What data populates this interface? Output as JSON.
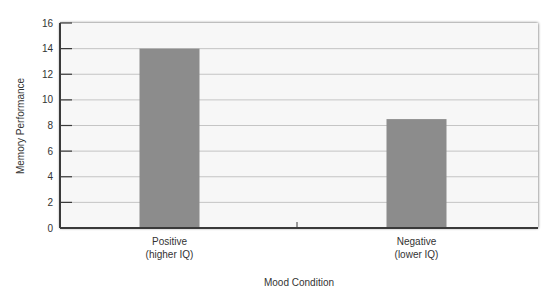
{
  "chart_data": {
    "type": "bar",
    "title": "",
    "categories": [
      "Positive (higher IQ)",
      "Negative (lower IQ)"
    ],
    "category_lines": [
      [
        "Positive",
        "(higher IQ)"
      ],
      [
        "Negative",
        "(lower IQ)"
      ]
    ],
    "values": [
      14,
      8.5
    ],
    "xlabel": "Mood Condition",
    "ylabel": "Memory Performance",
    "ylim": [
      0,
      16
    ],
    "yticks": [
      0,
      2,
      4,
      6,
      8,
      10,
      12,
      14,
      16
    ],
    "grid": true,
    "legend": "none",
    "colors": {
      "bar_fill": "#8c8c8c",
      "plot_background": "#f7f7f7",
      "gridline": "#b8b8b8",
      "axis": "#3a3a3a",
      "text": "#333333"
    }
  }
}
